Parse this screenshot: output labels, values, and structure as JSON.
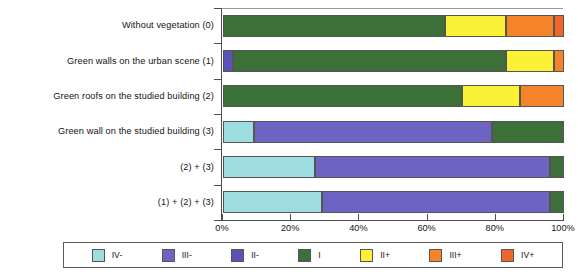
{
  "chart_data": {
    "type": "bar",
    "orientation": "horizontal",
    "stacked": true,
    "normalized_percent": true,
    "title": "",
    "subtitle": "",
    "xlabel": "",
    "ylabel": "",
    "xlim": [
      0,
      100
    ],
    "xticks": [
      0,
      20,
      40,
      60,
      80,
      100
    ],
    "xticklabels": [
      "0%",
      "20%",
      "40%",
      "60%",
      "80%",
      "100%"
    ],
    "grid": false,
    "legend_position": "bottom",
    "categories": [
      "Without vegetation (0)",
      "Green walls on the urban scene  (1)",
      "Green roofs on the studied building (2)",
      "Green wall on the studied building (3)",
      "(2) + (3)",
      "(1) + (2) + (3)"
    ],
    "series": [
      {
        "name": "IV-",
        "color": "#9ddde0",
        "values": [
          0,
          0,
          0,
          9,
          27,
          29
        ]
      },
      {
        "name": "III-",
        "color": "#6d63c2",
        "values": [
          0,
          0,
          0,
          70,
          69,
          67
        ]
      },
      {
        "name": "II-",
        "color": "#5b54b8",
        "values": [
          0,
          3,
          0,
          0,
          0,
          0
        ]
      },
      {
        "name": "I",
        "color": "#3d7038",
        "values": [
          65,
          80,
          70,
          21,
          4,
          4
        ]
      },
      {
        "name": "II+",
        "color": "#fbf238",
        "values": [
          18,
          14,
          17,
          0,
          0,
          0
        ]
      },
      {
        "name": "III+",
        "color": "#f5832a",
        "values": [
          14,
          3,
          13,
          0,
          0,
          0
        ]
      },
      {
        "name": "IV+",
        "color": "#f0662a",
        "values": [
          3,
          0,
          0,
          0,
          0,
          0
        ]
      }
    ]
  },
  "legend": {
    "items": [
      {
        "label": "IV-",
        "color": "#9ddde0"
      },
      {
        "label": "III-",
        "color": "#6d63c2"
      },
      {
        "label": "II-",
        "color": "#5b54b8"
      },
      {
        "label": "I",
        "color": "#3d7038"
      },
      {
        "label": "II+",
        "color": "#fbf238"
      },
      {
        "label": "III+",
        "color": "#f5832a"
      },
      {
        "label": "IV+",
        "color": "#f0662a"
      }
    ]
  },
  "axis": {
    "x_tick_labels": [
      "0%",
      "20%",
      "40%",
      "60%",
      "80%",
      "100%"
    ],
    "category_labels": [
      "Without vegetation (0)",
      "Green walls on the urban scene  (1)",
      "Green roofs on the studied building (2)",
      "Green wall on the studied building (3)",
      "(2) + (3)",
      "(1) + (2) + (3)"
    ]
  }
}
